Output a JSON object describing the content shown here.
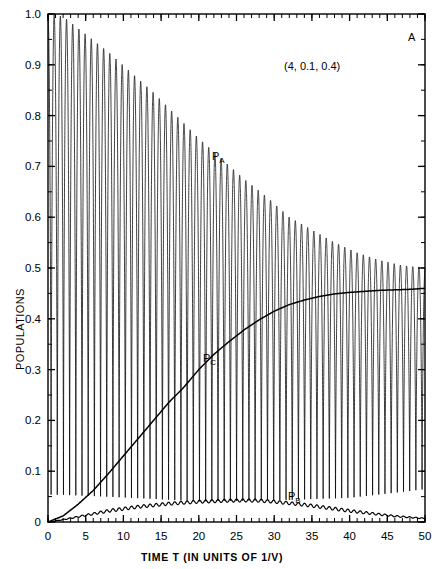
{
  "figure": {
    "panel_label": "A",
    "annotation": "(4, 0.1, 0.4)",
    "xtitle": "TIME T (IN UNITS OF 1/V)",
    "ytitle": "POPULATIONS",
    "curve_labels": {
      "a": "P",
      "a_sub": "A",
      "b": "P",
      "b_sub": "B",
      "c": "P",
      "c_sub": "C"
    }
  },
  "chart_data": {
    "type": "line",
    "title": "",
    "subtitle": "(4, 0.1, 0.4)",
    "xlabel": "TIME T (IN UNITS OF 1/V)",
    "ylabel": "POPULATIONS",
    "xlim": [
      0,
      50
    ],
    "ylim": [
      0,
      1.0
    ],
    "xticks": [
      0,
      5,
      10,
      15,
      20,
      25,
      30,
      35,
      40,
      45,
      50
    ],
    "xtick_labels": [
      "0",
      "5",
      "10",
      "15",
      "20",
      "25",
      "30",
      "35",
      "40",
      "45",
      "50"
    ],
    "xminor_step": 1,
    "yticks": [
      0,
      0.1,
      0.2,
      0.3,
      0.4,
      0.5,
      0.6,
      0.7,
      0.8,
      0.9,
      1.0
    ],
    "ytick_labels": [
      "0",
      "0.1",
      "0.2",
      "0.3",
      "0.4",
      "0.5",
      "0.6",
      "0.7",
      "0.8",
      "0.9",
      "1.0"
    ],
    "yminor_step": 0.05,
    "grid": false,
    "legend": "inline-labels",
    "ticks_direction": "in",
    "line_color": "#000000",
    "parameters": [
      4,
      0.1,
      0.4
    ],
    "oscillation_period": 0.82,
    "series": [
      {
        "name": "P_A",
        "label": "P",
        "label_sub": "A",
        "label_at": [
          21.5,
          0.715
        ],
        "description": "Rapid oscillation between a slowly decaying upper envelope and a lower envelope near zero",
        "upper_envelope_x": [
          0,
          2,
          5,
          8,
          11,
          14,
          17,
          20,
          23,
          26,
          29,
          32,
          35,
          38,
          41,
          44,
          47,
          50
        ],
        "upper_envelope_y": [
          1.0,
          0.995,
          0.96,
          0.925,
          0.885,
          0.845,
          0.8,
          0.755,
          0.715,
          0.675,
          0.64,
          0.6,
          0.575,
          0.55,
          0.53,
          0.515,
          0.505,
          0.5
        ],
        "lower_envelope_x": [
          0,
          5,
          10,
          15,
          20,
          25,
          30,
          35,
          40,
          45,
          50
        ],
        "lower_envelope_y": [
          0.0,
          0.0,
          0.0,
          0.0,
          0.0,
          0.005,
          0.01,
          0.015,
          0.02,
          0.03,
          0.04
        ]
      },
      {
        "name": "P_C",
        "label": "P",
        "label_sub": "C",
        "label_at": [
          20.5,
          0.315
        ],
        "description": "Smooth monotonic sigmoid rise from 0 to about 0.46",
        "x": [
          0,
          2,
          4,
          6,
          8,
          10,
          12,
          14,
          16,
          18,
          20,
          22,
          24,
          26,
          28,
          30,
          32,
          34,
          36,
          38,
          40,
          42,
          44,
          46,
          48,
          50
        ],
        "y": [
          0.0,
          0.012,
          0.035,
          0.062,
          0.095,
          0.13,
          0.165,
          0.2,
          0.235,
          0.265,
          0.3,
          0.33,
          0.355,
          0.378,
          0.398,
          0.415,
          0.428,
          0.437,
          0.444,
          0.449,
          0.452,
          0.454,
          0.456,
          0.457,
          0.458,
          0.46
        ]
      },
      {
        "name": "P_B",
        "label": "P",
        "label_sub": "B",
        "label_at": [
          33.0,
          0.052
        ],
        "description": "Low amplitude rippled curve rising to a broad maximum near T=27 then decaying",
        "x": [
          0,
          2,
          4,
          6,
          8,
          10,
          12,
          14,
          16,
          18,
          20,
          22,
          24,
          26,
          28,
          30,
          32,
          34,
          36,
          38,
          40,
          42,
          44,
          46,
          48,
          50
        ],
        "y": [
          0.0,
          0.004,
          0.009,
          0.014,
          0.019,
          0.023,
          0.027,
          0.03,
          0.033,
          0.035,
          0.037,
          0.038,
          0.039,
          0.0395,
          0.039,
          0.037,
          0.034,
          0.031,
          0.027,
          0.023,
          0.019,
          0.016,
          0.013,
          0.01,
          0.008,
          0.006
        ],
        "ripple_amplitude": 0.006
      }
    ]
  }
}
